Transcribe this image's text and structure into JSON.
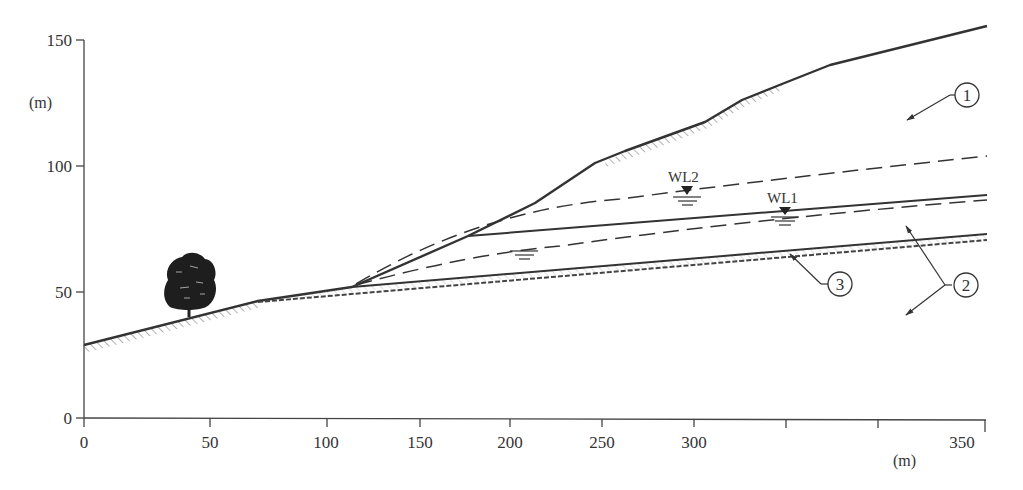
{
  "figure": {
    "y_axis": {
      "unit_label": "(m)",
      "ticks": [
        {
          "value": 0,
          "label": "0"
        },
        {
          "value": 50,
          "label": "50"
        },
        {
          "value": 100,
          "label": "100"
        },
        {
          "value": 150,
          "label": "150"
        }
      ]
    },
    "x_axis": {
      "unit_label": "(m)",
      "ticks": [
        {
          "value": 0,
          "label": "0"
        },
        {
          "value": 50,
          "label": "50"
        },
        {
          "value": 100,
          "label": "100"
        },
        {
          "value": 150,
          "label": "150"
        },
        {
          "value": 200,
          "label": "200"
        },
        {
          "value": 250,
          "label": "250"
        },
        {
          "value": 300,
          "label": "300"
        },
        {
          "value": 350,
          "label": "350"
        }
      ]
    },
    "water_levels": [
      {
        "id": "wl2",
        "label": "WL2",
        "x": 238,
        "y": 88
      },
      {
        "id": "wl1",
        "label": "WL1",
        "x": 276,
        "y": 81
      }
    ],
    "callouts": [
      {
        "id": "c1",
        "label": "1"
      },
      {
        "id": "c2",
        "label": "2"
      },
      {
        "id": "c3",
        "label": "3"
      }
    ],
    "ground_surface_profile": [
      [
        0,
        29
      ],
      [
        68,
        46
      ],
      [
        105,
        52
      ],
      [
        150,
        72
      ],
      [
        178,
        85
      ],
      [
        200,
        99
      ],
      [
        215,
        105
      ],
      [
        248,
        117
      ],
      [
        260,
        126
      ],
      [
        275,
        132
      ],
      [
        295,
        140
      ],
      [
        350,
        156
      ]
    ],
    "colors": {
      "line": "#333333",
      "hatch": "#555555",
      "background": "#ffffff"
    }
  }
}
